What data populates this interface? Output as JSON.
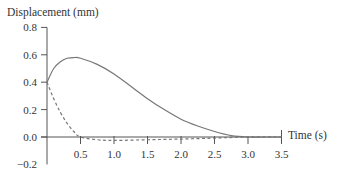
{
  "chart_data": {
    "type": "line",
    "title": "",
    "ylabel": "Displacement (mm)",
    "xlabel": "Time (s)",
    "xlim": [
      0,
      3.5
    ],
    "ylim": [
      -0.2,
      0.8
    ],
    "x_ticks": [
      "0.5",
      "1.0",
      "1.5",
      "2.0",
      "2.5",
      "3.0",
      "3.5"
    ],
    "y_ticks": [
      "0.8",
      "0.6",
      "0.4",
      "0.2",
      "0.0",
      "−0.2"
    ],
    "grid": false,
    "legend": "none",
    "series": [
      {
        "name": "solid",
        "style": "solid",
        "color": "#777777",
        "x": [
          0,
          0.1,
          0.2,
          0.3,
          0.4,
          0.5,
          0.75,
          1.0,
          1.25,
          1.5,
          1.75,
          2.0,
          2.25,
          2.5,
          2.75,
          3.0,
          3.25,
          3.5
        ],
        "y": [
          0.4,
          0.5,
          0.55,
          0.575,
          0.58,
          0.575,
          0.53,
          0.46,
          0.37,
          0.28,
          0.2,
          0.13,
          0.08,
          0.04,
          0.01,
          0.0,
          0.0,
          0.0
        ]
      },
      {
        "name": "dashed",
        "style": "dashed",
        "color": "#777777",
        "x": [
          0,
          0.1,
          0.2,
          0.3,
          0.4,
          0.5,
          0.75,
          1.0,
          1.5,
          2.0,
          2.5,
          3.0,
          3.5
        ],
        "y": [
          0.4,
          0.28,
          0.18,
          0.1,
          0.04,
          0.0,
          -0.02,
          -0.025,
          -0.02,
          -0.015,
          -0.008,
          0.0,
          0.0
        ]
      }
    ]
  }
}
